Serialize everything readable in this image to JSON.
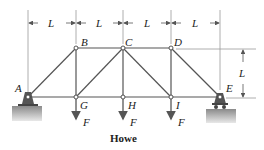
{
  "diagram": {
    "title": "Howe",
    "type": "truss",
    "joints": {
      "A": "A",
      "B": "B",
      "C": "C",
      "D": "D",
      "E": "E",
      "G": "G",
      "H": "H",
      "I": "I"
    },
    "dimension_label": "L",
    "load_label": "F",
    "dimensions": [
      "L",
      "L",
      "L",
      "L"
    ],
    "height_label": "L",
    "colors": {
      "member": "#555555",
      "support": "#666666",
      "ground": "#b0b0b0",
      "dim": "#777777"
    }
  }
}
